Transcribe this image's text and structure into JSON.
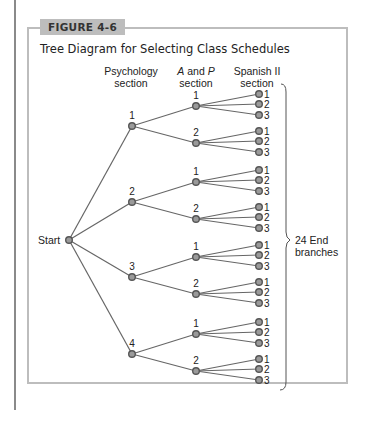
{
  "figure": {
    "label": "FIGURE 4-6",
    "title": "Tree Diagram for Selecting Class Schedules"
  },
  "headers": {
    "psychology": [
      "Psychology",
      "section"
    ],
    "ap": [
      "A and P",
      "section"
    ],
    "spanish": [
      "Spanish II",
      "section"
    ]
  },
  "start_label": "Start",
  "summary": [
    "24 End",
    "branches"
  ],
  "tree": {
    "psychology_sections": [
      "1",
      "2",
      "3",
      "4"
    ],
    "ap_sections": [
      "1",
      "2"
    ],
    "spanish_sections": [
      "1",
      "2",
      "3"
    ],
    "total_end_branches": 24
  },
  "colors": {
    "line": "#666666",
    "node_fill": "#9a9a9a",
    "node_stroke": "#555555",
    "frame": "#bdbdbd"
  }
}
